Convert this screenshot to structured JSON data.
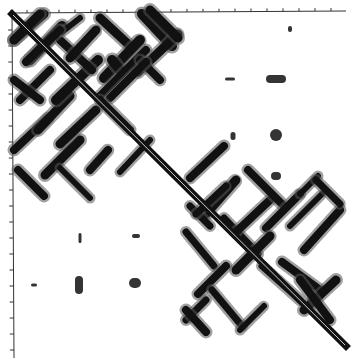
{
  "figure": {
    "type": "contact-map",
    "colors": {
      "background": "#ffffff",
      "contacts": "#111111",
      "axis": "#333333",
      "halo": "#555555"
    },
    "axes": {
      "top": {
        "x_start": 11,
        "x_end": 346,
        "y": 12,
        "tick_spacing": 16,
        "tick_count": 21
      },
      "left": {
        "y_start": 12,
        "y_end": 358,
        "x": 12,
        "tick_spacing": 16,
        "tick_count": 21
      }
    },
    "diagonal": {
      "from": [
        12,
        14
      ],
      "to": [
        346,
        346
      ],
      "width": 7
    },
    "domains": [
      {
        "name": "domain-1",
        "range": [
          12,
          180
        ]
      },
      {
        "name": "domain-2",
        "range": [
          180,
          346
        ]
      }
    ]
  },
  "chart_data": {
    "type": "heatmap",
    "title": "",
    "xlabel": "",
    "ylabel": "",
    "grid": false,
    "symmetric": true,
    "strands_antiparallel": [
      {
        "a": [
          16,
          50
        ],
        "b": [
          52,
          18
        ]
      },
      {
        "a": [
          40,
          70
        ],
        "b": [
          75,
          30
        ]
      },
      {
        "a": [
          60,
          88
        ],
        "b": [
          92,
          55
        ]
      },
      {
        "a": [
          100,
          40
        ],
        "b": [
          130,
          12
        ]
      },
      {
        "a": [
          115,
          56
        ],
        "b": [
          150,
          20
        ]
      },
      {
        "a": [
          140,
          64
        ],
        "b": [
          175,
          28
        ]
      },
      {
        "a": [
          190,
          180
        ],
        "b": [
          225,
          146
        ]
      },
      {
        "a": [
          235,
          230
        ],
        "b": [
          268,
          196
        ]
      },
      {
        "a": [
          250,
          270
        ],
        "b": [
          290,
          236
        ]
      },
      {
        "a": [
          280,
          300
        ],
        "b": [
          320,
          262
        ]
      },
      {
        "a": [
          300,
          335
        ],
        "b": [
          335,
          300
        ]
      }
    ],
    "interface_clusters": [
      {
        "x": 276,
        "y": 79,
        "w": 20,
        "h": 8
      },
      {
        "x": 230,
        "y": 79,
        "w": 10,
        "h": 3
      },
      {
        "x": 276,
        "y": 135,
        "w": 12,
        "h": 12
      },
      {
        "x": 233,
        "y": 136,
        "w": 5,
        "h": 8
      },
      {
        "x": 276,
        "y": 176,
        "w": 10,
        "h": 8
      },
      {
        "x": 79,
        "y": 285,
        "w": 8,
        "h": 18
      },
      {
        "x": 135,
        "y": 283,
        "w": 12,
        "h": 10
      },
      {
        "x": 80,
        "y": 238,
        "w": 3,
        "h": 10
      },
      {
        "x": 136,
        "y": 236,
        "w": 8,
        "h": 4
      },
      {
        "x": 34,
        "y": 285,
        "w": 6,
        "h": 3
      },
      {
        "x": 290,
        "y": 29,
        "w": 4,
        "h": 6
      }
    ]
  }
}
